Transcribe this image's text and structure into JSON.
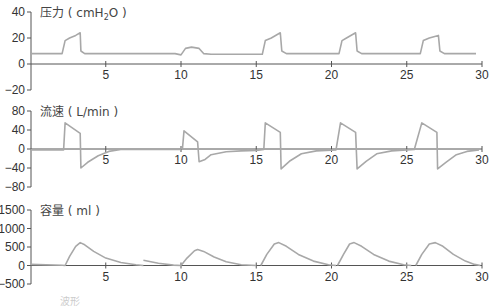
{
  "chart_data": {
    "type": "line",
    "x_range": [
      0,
      30
    ],
    "x_ticks": [
      5,
      10,
      15,
      20,
      25,
      30
    ],
    "grid": false,
    "panels": [
      {
        "title": "压力（cmH₂O）",
        "title_main": "压力 ( cmH",
        "title_sub": "2",
        "title_end": "O )",
        "ylabel": "Pressure (cmH2O)",
        "y_ticks": [
          40,
          20,
          0,
          -20
        ],
        "ylim": [
          -20,
          40
        ],
        "series": [
          {
            "name": "pressure",
            "points": [
              [
                0,
                8
              ],
              [
                2.1,
                8
              ],
              [
                2.3,
                18
              ],
              [
                2.6,
                20
              ],
              [
                3.0,
                22
              ],
              [
                3.3,
                24
              ],
              [
                3.35,
                10
              ],
              [
                3.6,
                8
              ],
              [
                9.6,
                8
              ],
              [
                10,
                7
              ],
              [
                10.3,
                12
              ],
              [
                10.7,
                13
              ],
              [
                11.2,
                12
              ],
              [
                11.5,
                8
              ],
              [
                12,
                7.5
              ],
              [
                15.4,
                7.5
              ],
              [
                15.6,
                18
              ],
              [
                16.0,
                20
              ],
              [
                16.6,
                24
              ],
              [
                16.7,
                10
              ],
              [
                17,
                8
              ],
              [
                20.5,
                8
              ],
              [
                20.7,
                18
              ],
              [
                21.0,
                20
              ],
              [
                21.6,
                24
              ],
              [
                21.7,
                10
              ],
              [
                22,
                8
              ],
              [
                25.9,
                8
              ],
              [
                26.1,
                18
              ],
              [
                26.5,
                20
              ],
              [
                27.1,
                22
              ],
              [
                27.2,
                10
              ],
              [
                27.5,
                8
              ],
              [
                29.6,
                8
              ]
            ]
          }
        ]
      },
      {
        "title": "流速（L/min）",
        "title_main": "流速 ( L/min )",
        "ylabel": "Flow (L/min)",
        "y_ticks": [
          80,
          40,
          0,
          -40,
          -80
        ],
        "ylim": [
          -80,
          80
        ],
        "series": [
          {
            "name": "flow",
            "points": [
              [
                0,
                -2
              ],
              [
                2.2,
                -2
              ],
              [
                2.3,
                55
              ],
              [
                3.3,
                33
              ],
              [
                3.35,
                -40
              ],
              [
                3.8,
                -28
              ],
              [
                4.5,
                -14
              ],
              [
                5.2,
                -5
              ],
              [
                6,
                -1
              ],
              [
                9.9,
                -1
              ],
              [
                10.1,
                2
              ],
              [
                10.2,
                38
              ],
              [
                11.1,
                15
              ],
              [
                11.2,
                -27
              ],
              [
                11.6,
                -22
              ],
              [
                12,
                -12
              ],
              [
                12.5,
                -9
              ],
              [
                13,
                -6
              ],
              [
                14,
                -4
              ],
              [
                15,
                -3
              ],
              [
                15.5,
                -1
              ],
              [
                15.6,
                55
              ],
              [
                16.6,
                35
              ],
              [
                16.65,
                -42
              ],
              [
                17.2,
                -26
              ],
              [
                18,
                -10
              ],
              [
                19,
                -4
              ],
              [
                20.3,
                -2
              ],
              [
                20.6,
                55
              ],
              [
                21.6,
                35
              ],
              [
                21.7,
                -42
              ],
              [
                22.3,
                -26
              ],
              [
                23,
                -10
              ],
              [
                24,
                -4
              ],
              [
                25.5,
                -1
              ],
              [
                26.0,
                55
              ],
              [
                27.0,
                35
              ],
              [
                27.05,
                -42
              ],
              [
                27.6,
                -28
              ],
              [
                28.3,
                -12
              ],
              [
                29,
                -5
              ],
              [
                29.8,
                -2
              ]
            ]
          }
        ]
      },
      {
        "title": "容量（ml）",
        "title_main": "容量 ( ml )",
        "ylabel": "Volume (ml)",
        "y_ticks": [
          1500,
          1000,
          500,
          0,
          -500
        ],
        "ylim": [
          -500,
          1500
        ],
        "series": [
          {
            "name": "volume",
            "points": [
              [
                0,
                30
              ],
              [
                2.1,
                5
              ],
              [
                2.3,
                0
              ],
              [
                2.6,
                250
              ],
              [
                3.0,
                520
              ],
              [
                3.3,
                620
              ],
              [
                3.6,
                560
              ],
              [
                4.2,
                380
              ],
              [
                5,
                200
              ],
              [
                6,
                80
              ],
              [
                7,
                20
              ],
              [
                7.5,
                0
              ]
            ],
            "extra_segments": [
              [
                [
                  7.5,
                  140
                ],
                [
                  8.5,
                  60
                ],
                [
                  9.5,
                  10
                ],
                [
                  10,
                  0
                ]
              ],
              [
                [
                  10,
                  0
                ],
                [
                  10.4,
                  200
                ],
                [
                  10.9,
                  400
                ],
                [
                  11.1,
                  430
                ],
                [
                  11.5,
                  380
                ],
                [
                  12.2,
                  230
                ],
                [
                  13,
                  100
                ],
                [
                  14,
                  20
                ],
                [
                  15,
                  0
                ]
              ],
              [
                [
                  15.3,
                  0
                ],
                [
                  15.7,
                  300
                ],
                [
                  16.2,
                  580
                ],
                [
                  16.5,
                  620
                ],
                [
                  17,
                  520
                ],
                [
                  17.8,
                  300
                ],
                [
                  18.8,
                  120
                ],
                [
                  19.8,
                  20
                ],
                [
                  20.3,
                  0
                ]
              ],
              [
                [
                  20.4,
                  0
                ],
                [
                  20.8,
                  300
                ],
                [
                  21.2,
                  580
                ],
                [
                  21.5,
                  620
                ],
                [
                  22,
                  520
                ],
                [
                  22.8,
                  300
                ],
                [
                  23.8,
                  120
                ],
                [
                  24.8,
                  20
                ],
                [
                  25.3,
                  0
                ]
              ],
              [
                [
                  25.6,
                  0
                ],
                [
                  26.0,
                  300
                ],
                [
                  26.5,
                  580
                ],
                [
                  26.9,
                  620
                ],
                [
                  27.4,
                  520
                ],
                [
                  28.1,
                  300
                ],
                [
                  28.9,
                  120
                ],
                [
                  29.5,
                  30
                ],
                [
                  29.9,
                  0
                ]
              ]
            ]
          }
        ]
      }
    ],
    "colors": {
      "trace": "#a8a8a8",
      "axis": "#555555",
      "text": "#333333"
    }
  },
  "caption_fragment": "波形"
}
